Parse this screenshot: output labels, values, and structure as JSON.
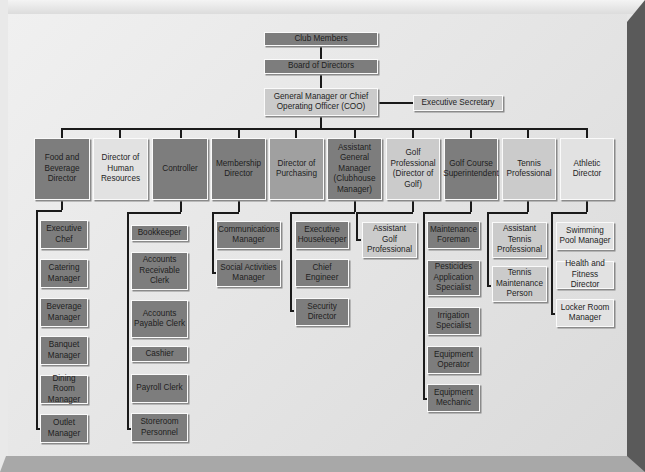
{
  "chart": {
    "top": [
      {
        "label": "Club Members"
      },
      {
        "label": "Board of Directors"
      },
      {
        "label": "General Manager or Chief Operating Officer (COO)"
      },
      {
        "label": "Executive Secretary"
      }
    ],
    "directors": [
      {
        "label": "Food and Beverage Director",
        "reports": [
          "Executive Chef",
          "Catering Manager",
          "Beverage Manager",
          "Banquet Manager",
          "Dining Room Manager",
          "Outlet Manager"
        ]
      },
      {
        "label": "Director of Human Resources",
        "reports": []
      },
      {
        "label": "Controller",
        "reports": [
          "Bookkeeper",
          "Accounts Receivable Clerk",
          "Accounts Payable Clerk",
          "Cashier",
          "Payroll Clerk",
          "Storeroom Personnel"
        ]
      },
      {
        "label": "Membership Director",
        "reports": [
          "Communications Manager",
          "Social Activities Manager"
        ]
      },
      {
        "label": "Director of Purchasing",
        "reports": []
      },
      {
        "label": "Assistant General Manager (Clubhouse Manager)",
        "reports": [
          "Executive Housekeeper",
          "Chief Engineer",
          "Security Director"
        ]
      },
      {
        "label": "Golf Professional (Director of Golf)",
        "reports": [
          "Assistant Golf Professional"
        ]
      },
      {
        "label": "Golf Course Superintendent",
        "reports": [
          "Maintenance Foreman",
          "Pesticides Application Specialist",
          "Irrigation Specialist",
          "Equipment Operator",
          "Equipment Mechanic"
        ]
      },
      {
        "label": "Tennis Professional",
        "reports": [
          "Assistant Tennis Professional",
          "Tennis Maintenance Person"
        ]
      },
      {
        "label": "Athletic Director",
        "reports": [
          "Swimming Pool Manager",
          "Health and Fitness Director",
          "Locker Room Manager"
        ]
      }
    ]
  },
  "colors": {
    "dark": "#7d7d7d",
    "mid": "#a0a0a0",
    "light": "#cbcbcb",
    "pale": "#e2e2e2",
    "line": "#1a1a1a"
  }
}
